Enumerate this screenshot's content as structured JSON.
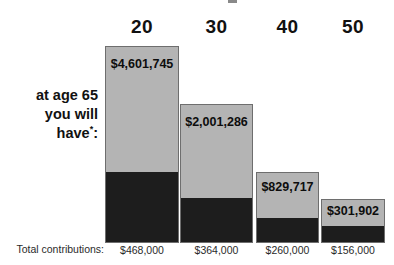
{
  "caption": {
    "lines": [
      "at age 65",
      "you will",
      "have"
    ],
    "footnote_marker": "*",
    "trailing": ":"
  },
  "contributions_row": {
    "label": "Total contributions:"
  },
  "chart_data": {
    "type": "bar",
    "title": "",
    "subtitle": "",
    "xlabel": "",
    "ylabel": "",
    "stacked": true,
    "grid": false,
    "legend": false,
    "categories": [
      "20",
      "30",
      "40",
      "50"
    ],
    "category_label": "age",
    "series": [
      {
        "name": "Total contributions",
        "color": "#1d1d1d",
        "values": [
          468000,
          364000,
          260000,
          156000
        ],
        "labels": [
          "$468,000",
          "$364,000",
          "$260,000",
          "$156,000"
        ]
      },
      {
        "name": "Growth",
        "color": "#b4b4b4",
        "values": [
          4133745,
          1637286,
          569717,
          145902
        ],
        "labels": [
          "$4,133,745",
          "$1,637,286",
          "$569,717",
          "$145,902"
        ]
      }
    ],
    "totals": [
      4601745,
      2001286,
      829717,
      301902
    ],
    "total_labels": [
      "$4,601,745",
      "$2,001,286",
      "$829,717",
      "$301,902"
    ],
    "ylim": [
      0,
      4601745
    ],
    "bars": [
      {
        "category": "20",
        "total_label": "$4,601,745",
        "contribution_label": "$468,000",
        "left": 105,
        "width": 74,
        "top": 46,
        "bottom": 243,
        "split": 173,
        "value_label_top": 57
      },
      {
        "category": "30",
        "total_label": "$2,001,286",
        "contribution_label": "$364,000",
        "left": 180,
        "width": 73,
        "top": 104,
        "bottom": 243,
        "split": 199,
        "value_label_top": 115
      },
      {
        "category": "40",
        "total_label": "$829,717",
        "contribution_label": "$260,000",
        "left": 256,
        "width": 63,
        "top": 172,
        "bottom": 243,
        "split": 219,
        "value_label_top": 180
      },
      {
        "category": "50",
        "total_label": "$301,902",
        "contribution_label": "$156,000",
        "left": 321,
        "width": 64,
        "top": 199,
        "bottom": 243,
        "split": 227,
        "value_label_top": 204
      }
    ]
  },
  "colors": {
    "growth_fill": "#b4b4b4",
    "contribution_fill": "#1d1d1d",
    "bar_outline": "#6e6e6e",
    "text": "#111111",
    "background": "#ffffff"
  }
}
